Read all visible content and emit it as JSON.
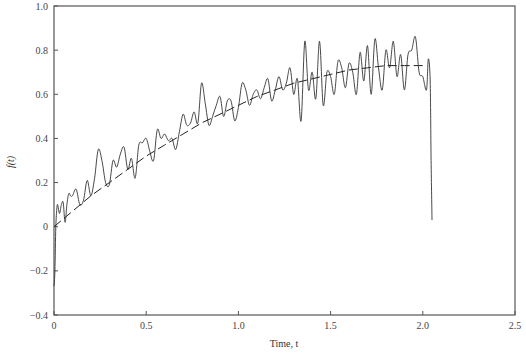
{
  "chart_data": {
    "type": "line",
    "title": "",
    "xlabel": "Time, t",
    "ylabel": "f(t)",
    "xlim": [
      0,
      2.5
    ],
    "ylim": [
      -0.4,
      1.0
    ],
    "grid": false,
    "legend": null,
    "xticks": [
      "0",
      "0.5",
      "1.0",
      "1.5",
      "2.0",
      "2.5"
    ],
    "yticks": [
      "-0.4",
      "-0.2",
      "0",
      "0.2",
      "0.4",
      "0.6",
      "0.8",
      "1.0"
    ],
    "series": [
      {
        "name": "noisy signal",
        "style": "solid",
        "x": [
          0.0,
          0.005,
          0.01,
          0.015,
          0.02,
          0.03,
          0.04,
          0.05,
          0.06,
          0.07,
          0.08,
          0.09,
          0.1,
          0.12,
          0.14,
          0.16,
          0.18,
          0.2,
          0.22,
          0.24,
          0.26,
          0.28,
          0.3,
          0.32,
          0.34,
          0.36,
          0.38,
          0.4,
          0.42,
          0.44,
          0.46,
          0.48,
          0.5,
          0.52,
          0.54,
          0.56,
          0.58,
          0.6,
          0.62,
          0.64,
          0.66,
          0.68,
          0.7,
          0.72,
          0.74,
          0.76,
          0.78,
          0.8,
          0.82,
          0.84,
          0.86,
          0.88,
          0.9,
          0.92,
          0.94,
          0.96,
          0.98,
          1.0,
          1.02,
          1.04,
          1.06,
          1.08,
          1.1,
          1.12,
          1.14,
          1.16,
          1.18,
          1.2,
          1.22,
          1.24,
          1.26,
          1.28,
          1.3,
          1.32,
          1.34,
          1.36,
          1.38,
          1.4,
          1.42,
          1.44,
          1.46,
          1.48,
          1.5,
          1.52,
          1.54,
          1.56,
          1.58,
          1.6,
          1.62,
          1.64,
          1.66,
          1.68,
          1.7,
          1.72,
          1.74,
          1.76,
          1.78,
          1.8,
          1.82,
          1.84,
          1.86,
          1.88,
          1.9,
          1.92,
          1.94,
          1.96,
          1.98,
          2.0,
          2.02,
          2.03,
          2.04,
          2.045,
          2.05
        ],
        "y": [
          -0.27,
          -0.2,
          0.0,
          0.08,
          0.1,
          0.06,
          0.1,
          0.11,
          0.02,
          0.1,
          0.15,
          0.14,
          0.14,
          0.17,
          0.1,
          0.12,
          0.21,
          0.14,
          0.22,
          0.35,
          0.3,
          0.2,
          0.19,
          0.3,
          0.27,
          0.33,
          0.36,
          0.26,
          0.31,
          0.22,
          0.37,
          0.38,
          0.4,
          0.34,
          0.3,
          0.44,
          0.4,
          0.42,
          0.39,
          0.4,
          0.35,
          0.43,
          0.51,
          0.46,
          0.47,
          0.52,
          0.47,
          0.65,
          0.56,
          0.46,
          0.5,
          0.55,
          0.59,
          0.5,
          0.57,
          0.57,
          0.48,
          0.54,
          0.65,
          0.62,
          0.55,
          0.6,
          0.62,
          0.58,
          0.63,
          0.67,
          0.57,
          0.62,
          0.68,
          0.62,
          0.65,
          0.72,
          0.6,
          0.67,
          0.48,
          0.84,
          0.62,
          0.7,
          0.58,
          0.84,
          0.55,
          0.7,
          0.68,
          0.6,
          0.75,
          0.72,
          0.63,
          0.74,
          0.7,
          0.6,
          0.79,
          0.66,
          0.82,
          0.6,
          0.85,
          0.72,
          0.62,
          0.8,
          0.72,
          0.84,
          0.68,
          0.78,
          0.62,
          0.78,
          0.8,
          0.86,
          0.7,
          0.68,
          0.62,
          0.76,
          0.66,
          0.3,
          0.03
        ]
      },
      {
        "name": "smooth trend",
        "style": "dashed",
        "x": [
          0.0,
          0.1,
          0.2,
          0.3,
          0.4,
          0.5,
          0.6,
          0.7,
          0.8,
          0.9,
          1.0,
          1.1,
          1.2,
          1.3,
          1.4,
          1.5,
          1.6,
          1.7,
          1.8,
          1.9,
          2.0
        ],
        "y": [
          0.0,
          0.07,
          0.14,
          0.2,
          0.26,
          0.32,
          0.37,
          0.42,
          0.47,
          0.51,
          0.55,
          0.59,
          0.62,
          0.65,
          0.67,
          0.69,
          0.71,
          0.72,
          0.73,
          0.73,
          0.73
        ]
      }
    ]
  }
}
